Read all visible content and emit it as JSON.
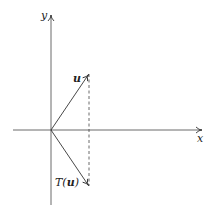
{
  "diagram": {
    "title": "",
    "axes": {
      "x_label": "x",
      "y_label": "y"
    },
    "vectors": [
      {
        "name": "u",
        "label": "u",
        "from": [
          0,
          0
        ],
        "to": [
          1,
          1.5
        ]
      },
      {
        "name": "T(u)",
        "label_prefix": "T(",
        "label_arg": "u",
        "label_suffix": ")",
        "from": [
          0,
          0
        ],
        "to": [
          1,
          -1.5
        ]
      }
    ],
    "guides": [
      {
        "type": "dashed",
        "from": [
          1,
          1.5
        ],
        "to": [
          1,
          -1.5
        ]
      }
    ],
    "colors": {
      "stroke": "#333333",
      "background": "#ffffff"
    }
  }
}
